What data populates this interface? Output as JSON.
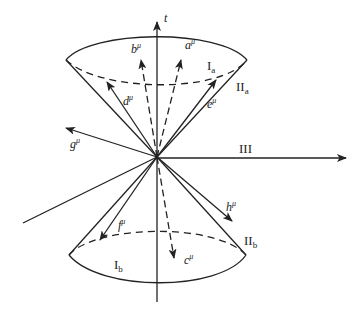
{
  "diagram": {
    "colors": {
      "ink": "#222222",
      "background": "#ffffff"
    },
    "axes": {
      "time": {
        "label": "t"
      },
      "spatial": {
        "label": "III"
      }
    },
    "regions": {
      "upper_interior": {
        "label": "I",
        "sub": "a"
      },
      "upper_surface": {
        "label": "II",
        "sub": "a"
      },
      "lower_interior": {
        "label": "I",
        "sub": "b"
      },
      "lower_surface": {
        "label": "II",
        "sub": "b"
      },
      "outside": {
        "label": "III"
      }
    },
    "vectors": [
      {
        "name": "a",
        "sup": "μ",
        "style": "dashed",
        "region": "I_a"
      },
      {
        "name": "b",
        "sup": "μ",
        "style": "dashed",
        "region": "I_a"
      },
      {
        "name": "c",
        "sup": "μ",
        "style": "dashed",
        "region": "I_b"
      },
      {
        "name": "d",
        "sup": "μ",
        "style": "solid",
        "region": "II_a"
      },
      {
        "name": "e",
        "sup": "μ",
        "style": "solid",
        "region": "II_a"
      },
      {
        "name": "f",
        "sup": "μ",
        "style": "solid",
        "region": "II_b"
      },
      {
        "name": "g",
        "sup": "μ",
        "style": "solid",
        "region": "III"
      },
      {
        "name": "h",
        "sup": "μ",
        "style": "solid",
        "region": "III"
      }
    ]
  }
}
